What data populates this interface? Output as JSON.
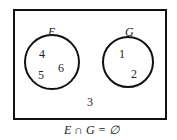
{
  "diagram": {
    "type": "venn",
    "sets": [
      {
        "name": "E",
        "elements": [
          "4",
          "5",
          "6"
        ]
      },
      {
        "name": "G",
        "elements": [
          "1",
          "2"
        ]
      }
    ],
    "outside_elements": [
      "3"
    ],
    "caption": "E ∩ G = ∅"
  }
}
